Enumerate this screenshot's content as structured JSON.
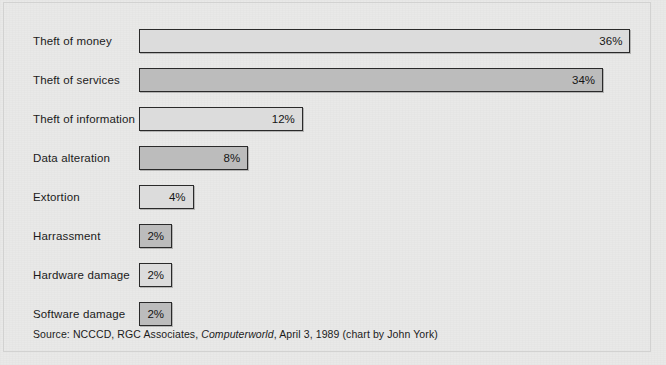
{
  "chart_data": {
    "type": "bar",
    "orientation": "horizontal",
    "title": "",
    "subtitle": "",
    "xlabel": "",
    "ylabel": "",
    "categories": [
      "Theft of money",
      "Theft of services",
      "Theft of information",
      "Data alteration",
      "Extortion",
      "Harrassment",
      "Hardware damage",
      "Software damage"
    ],
    "values": [
      36,
      34,
      12,
      8,
      4,
      2,
      2,
      2
    ],
    "value_labels": [
      "36%",
      "34%",
      "12%",
      "8%",
      "4%",
      "2%",
      "2%",
      "2%"
    ],
    "xlim": [
      0,
      36
    ],
    "grid": false,
    "legend": false,
    "value_label_position": "inside-right",
    "bar_fills": [
      "#dcdcdc",
      "#bcbcbc",
      "#dcdcdc",
      "#bcbcbc",
      "#dcdcdc",
      "#bcbcbc",
      "#dcdcdc",
      "#bcbcbc"
    ],
    "bar_edge_color": "#2a2a2a",
    "background_color": "#e9e9e8"
  },
  "source": {
    "prefix": "Source:  NCCCD, RGC Associates, ",
    "publication": "Computerworld",
    "suffix": ", April 3, 1989 (chart by John York)"
  }
}
